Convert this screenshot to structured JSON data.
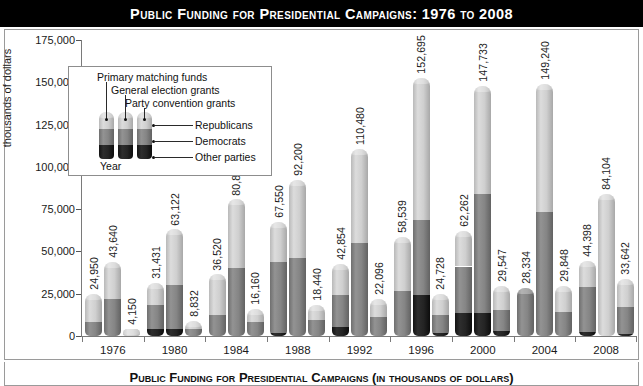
{
  "title": "Public Funding for Presidential Campaigns: 1976 to 2008",
  "caption": "Public Funding for Presidential Campaigns (in thousands of dollars)",
  "axis": {
    "y_title": "thousands of dollars",
    "y_ticks": [
      "0",
      "25,000",
      "50,000",
      "75,000",
      "100,000",
      "125,000",
      "150,000",
      "175,000"
    ]
  },
  "legend": {
    "segment_labels": [
      "Primary matching funds",
      "General election grants",
      "Party convention grants"
    ],
    "series_labels": [
      "Republicans",
      "Democrats",
      "Other parties"
    ],
    "x_label": "Year"
  },
  "colors": {
    "primary_matching_funds": "#cfcfcf",
    "general_election_grants": "#858585",
    "party_convention_grants": "#1f1f1f",
    "title_banner": "#000000",
    "frame_border": "#9a9a9a",
    "background": "#ffffff"
  },
  "chart_data": {
    "type": "bar",
    "title": "Public Funding for Presidential Campaigns: 1976 to 2008",
    "xlabel": "Year",
    "ylabel": "thousands of dollars",
    "ylim": [
      0,
      175000
    ],
    "grid": false,
    "legend_position": "inside-upper-left",
    "stacked": true,
    "categories": [
      "1976",
      "1980",
      "1984",
      "1988",
      "1992",
      "1996",
      "2000",
      "2004",
      "2008"
    ],
    "groups": [
      "Republicans",
      "Democrats",
      "Other parties"
    ],
    "stack_segments": [
      "Party convention grants",
      "General election grants",
      "Primary matching funds"
    ],
    "series": [
      {
        "name": "Republicans",
        "values": [
          24950,
          31431,
          36520,
          67550,
          42854,
          58539,
          62262,
          28334,
          44398
        ],
        "labels": [
          "24,950",
          "31,431",
          "36,520",
          "67,550",
          "42,854",
          "58,539",
          "62,262",
          "28,334",
          "44,398"
        ],
        "breakdown": [
          {
            "party_convention_grants": 0,
            "general_election_grants": 8500,
            "primary_matching_funds": 16450
          },
          {
            "party_convention_grants": 4400,
            "general_election_grants": 14200,
            "primary_matching_funds": 12831
          },
          {
            "party_convention_grants": 0,
            "general_election_grants": 12200,
            "primary_matching_funds": 24320
          },
          {
            "party_convention_grants": 1600,
            "general_election_grants": 42000,
            "primary_matching_funds": 23950
          },
          {
            "party_convention_grants": 5500,
            "general_election_grants": 18800,
            "primary_matching_funds": 18554
          },
          {
            "party_convention_grants": 0,
            "general_election_grants": 26400,
            "primary_matching_funds": 32139
          },
          {
            "party_convention_grants": 13500,
            "general_election_grants": 27600,
            "primary_matching_funds": 21162
          },
          {
            "party_convention_grants": 0,
            "general_election_grants": 28334,
            "primary_matching_funds": 0
          },
          {
            "party_convention_grants": 2200,
            "general_election_grants": 26600,
            "primary_matching_funds": 15598
          }
        ]
      },
      {
        "name": "Democrats",
        "values": [
          43640,
          63122,
          80800,
          92200,
          110480,
          152695,
          147733,
          149240,
          84104
        ],
        "labels": [
          "43,640",
          "63,122",
          "80,800",
          "92,200",
          "110,480",
          "152,695",
          "147,733",
          "149,240",
          "84,104"
        ],
        "breakdown": [
          {
            "party_convention_grants": 0,
            "general_election_grants": 21800,
            "primary_matching_funds": 21840
          },
          {
            "party_convention_grants": 4400,
            "general_election_grants": 25900,
            "primary_matching_funds": 32822
          },
          {
            "party_convention_grants": 0,
            "general_election_grants": 40400,
            "primary_matching_funds": 40400
          },
          {
            "party_convention_grants": 0,
            "general_election_grants": 46100,
            "primary_matching_funds": 46100
          },
          {
            "party_convention_grants": 0,
            "general_election_grants": 55200,
            "primary_matching_funds": 55280
          },
          {
            "party_convention_grants": 24500,
            "general_election_grants": 43900,
            "primary_matching_funds": 84295
          },
          {
            "party_convention_grants": 13600,
            "general_election_grants": 70500,
            "primary_matching_funds": 63633
          },
          {
            "party_convention_grants": 0,
            "general_election_grants": 73200,
            "primary_matching_funds": 76040
          },
          {
            "party_convention_grants": 0,
            "general_election_grants": 0,
            "primary_matching_funds": 84104
          }
        ]
      },
      {
        "name": "Other parties",
        "values": [
          4150,
          8832,
          16160,
          18440,
          22096,
          24728,
          29547,
          29848,
          33642
        ],
        "labels": [
          "4,150",
          "8,832",
          "16,160",
          "18,440",
          "22,096",
          "24,728",
          "29,547",
          "29,848",
          "33,642"
        ],
        "breakdown": [
          {
            "party_convention_grants": 0,
            "general_election_grants": 0,
            "primary_matching_funds": 4150
          },
          {
            "party_convention_grants": 0,
            "general_election_grants": 4400,
            "primary_matching_funds": 4432
          },
          {
            "party_convention_grants": 0,
            "general_election_grants": 8100,
            "primary_matching_funds": 8060
          },
          {
            "party_convention_grants": 0,
            "general_election_grants": 9200,
            "primary_matching_funds": 9240
          },
          {
            "party_convention_grants": 0,
            "general_election_grants": 11000,
            "primary_matching_funds": 11096
          },
          {
            "party_convention_grants": 1500,
            "general_election_grants": 11200,
            "primary_matching_funds": 12028
          },
          {
            "party_convention_grants": 2900,
            "general_election_grants": 12200,
            "primary_matching_funds": 14447
          },
          {
            "party_convention_grants": 0,
            "general_election_grants": 14400,
            "primary_matching_funds": 15448
          },
          {
            "party_convention_grants": 1300,
            "general_election_grants": 15600,
            "primary_matching_funds": 16742
          }
        ]
      }
    ]
  }
}
